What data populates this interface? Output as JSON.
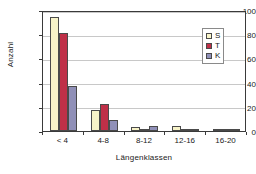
{
  "chart_data": {
    "type": "bar",
    "title": "",
    "subtitle": "",
    "xlabel": "Längenklassen",
    "ylabel": "Anzahl",
    "categories": [
      "< 4",
      "4-8",
      "8-12",
      "12-16",
      "16-20"
    ],
    "series": [
      {
        "name": "S",
        "color": "#F7F3C8",
        "values": [
          94,
          17,
          3,
          4,
          2
        ]
      },
      {
        "name": "T",
        "color": "#BF3048",
        "values": [
          81,
          22,
          2,
          1,
          1
        ]
      },
      {
        "name": "K",
        "color": "#9090B8",
        "values": [
          37,
          9,
          4,
          2,
          0
        ]
      }
    ],
    "ylim": [
      0,
      100
    ],
    "yticks": [
      0,
      20,
      40,
      60,
      80,
      100
    ],
    "ytick_labels": [
      "0",
      "20",
      "40",
      "60",
      "80",
      "100"
    ],
    "grid": "horizontal",
    "legend_position": "top-right",
    "legend_entries": [
      "S",
      "T",
      "K"
    ],
    "axis_color": "#3A3A3A",
    "gridline_color": "#C8C8C8",
    "bar_border_color": "#4A4A4A",
    "background_color": "#FFFFFF"
  }
}
